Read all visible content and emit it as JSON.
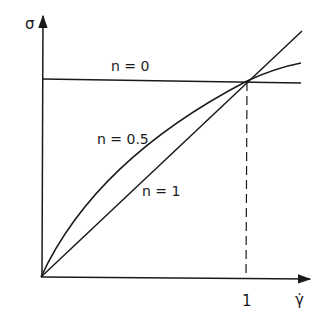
{
  "diagram": {
    "type": "flow-curve",
    "y_axis_label": "σ",
    "x_axis_label": "γ̇",
    "x_tick_label": "1",
    "curves": [
      {
        "id": "n0",
        "label": "n = 0",
        "shape": "horizontal line"
      },
      {
        "id": "n05",
        "label": "n = 0.5",
        "shape": "concave curve"
      },
      {
        "id": "n1",
        "label": "n = 1",
        "shape": "straight line through origin"
      }
    ],
    "intersection": "all curves meet at γ̇ = 1",
    "reference_line": "dashed vertical at γ̇ = 1",
    "line_color": "#1a1a1a"
  }
}
